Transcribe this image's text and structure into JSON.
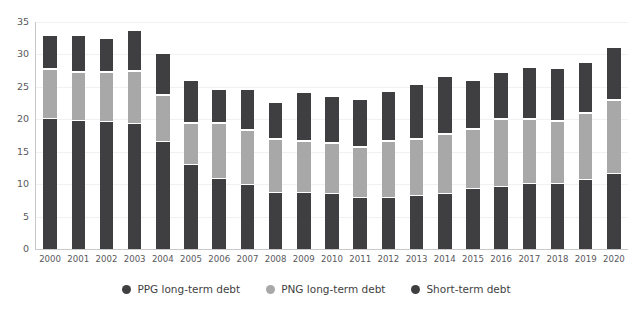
{
  "chart_data": {
    "type": "bar",
    "title": "",
    "subtitle": "",
    "xlabel": "",
    "ylabel": "",
    "stacked": true,
    "grid": true,
    "legend_position": "bottom-center",
    "ylim": [
      0,
      35
    ],
    "yticks": [
      0,
      5,
      10,
      15,
      20,
      25,
      30,
      35
    ],
    "ytick_labels": [
      "0",
      "5",
      "10",
      "15",
      "20",
      "25",
      "30",
      "35"
    ],
    "categories": [
      "2000",
      "2001",
      "2002",
      "2003",
      "2004",
      "2005",
      "2006",
      "2007",
      "2008",
      "2009",
      "2010",
      "2011",
      "2012",
      "2013",
      "2014",
      "2015",
      "2016",
      "2017",
      "2018",
      "2019",
      "2020"
    ],
    "series": [
      {
        "name": "PPG long-term debt",
        "color": "#3f3f42",
        "values": [
          20.0,
          19.7,
          19.6,
          19.3,
          16.5,
          12.9,
          10.8,
          9.9,
          8.7,
          8.6,
          8.5,
          7.9,
          7.9,
          8.2,
          8.5,
          9.3,
          9.6,
          10.0,
          10.1,
          10.7,
          11.6
        ]
      },
      {
        "name": "PNG long-term debt",
        "color": "#a8a8a8",
        "values": [
          7.8,
          7.6,
          7.7,
          8.2,
          7.3,
          6.6,
          8.6,
          8.4,
          8.2,
          8.1,
          7.8,
          7.9,
          8.8,
          8.7,
          9.3,
          9.2,
          10.4,
          10.0,
          9.6,
          10.2,
          11.4
        ]
      },
      {
        "name": "Short-term debt",
        "color": "#3f3f42",
        "values": [
          5.2,
          5.7,
          5.2,
          6.2,
          6.4,
          6.6,
          5.2,
          6.3,
          5.8,
          7.5,
          7.3,
          7.4,
          7.6,
          8.6,
          8.9,
          7.5,
          7.3,
          8.0,
          8.2,
          7.9,
          8.2
        ]
      }
    ],
    "totals": [
      33.0,
      33.0,
      32.5,
      33.7,
      30.2,
      26.1,
      24.6,
      24.6,
      22.7,
      24.2,
      23.6,
      23.2,
      24.3,
      25.5,
      26.7,
      26.0,
      27.3,
      28.0,
      27.9,
      28.8,
      31.2
    ]
  },
  "legend": {
    "items": [
      {
        "label": "PPG long-term debt",
        "color": "#3f3f42"
      },
      {
        "label": "PNG long-term debt",
        "color": "#a8a8a8"
      },
      {
        "label": "Short-term debt",
        "color": "#3f3f42"
      }
    ]
  },
  "colors": {
    "ppg": "#3f3f42",
    "png": "#a8a8a8",
    "short": "#3f3f42",
    "axis": "#c9c9c9",
    "grid": "#f1f1f1",
    "tick_text": "#58585b",
    "background": "#ffffff"
  }
}
